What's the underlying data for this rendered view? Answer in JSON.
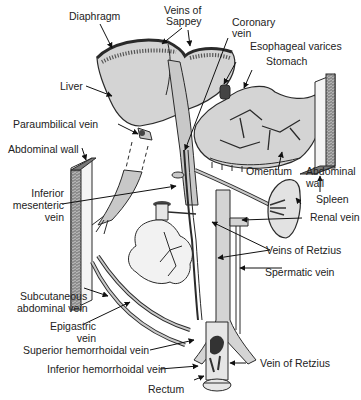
{
  "diagram": {
    "colors": {
      "organ_fill": "#d4d4d4",
      "vessel_fill": "#c8c8c8",
      "outline": "#2a2a2a",
      "dark": "#3a3a3a",
      "text": "#222222",
      "background": "#ffffff"
    },
    "labels": {
      "diaphragm": "Diaphragm",
      "veins_of_sappey_1": "Veins of",
      "veins_of_sappey_2": "Sappey",
      "coronary_vein_1": "Coronary",
      "coronary_vein_2": "vein",
      "esophageal_varices": "Esophageal varices",
      "stomach": "Stomach",
      "liver": "Liver",
      "paraumbilical_vein": "Paraumbilical vein",
      "abdominal_wall_left": "Abdominal wall",
      "inferior_mesenteric_1": "Inferior",
      "inferior_mesenteric_2": "mesenteric",
      "inferior_mesenteric_3": "vein",
      "omentum": "Omentum",
      "abdominal_wall_right_1": "Abdominal",
      "abdominal_wall_right_2": "wall",
      "spleen": "Spleen",
      "renal_vein": "Renal vein",
      "veins_of_retzius": "Veins of Retzius",
      "spermatic_vein": "Spermatic vein",
      "subcutaneous_1": "Subcutaneous",
      "subcutaneous_2": "abdominal vein",
      "epigastric_1": "Epigastric",
      "epigastric_2": "vein",
      "superior_hemorrhoidal": "Superior hemorrhoidal vein",
      "inferior_hemorrhoidal": "Inferior hemorrhoidal vein",
      "vein_of_retzius": "Vein of Retzius",
      "rectum": "Rectum"
    }
  }
}
